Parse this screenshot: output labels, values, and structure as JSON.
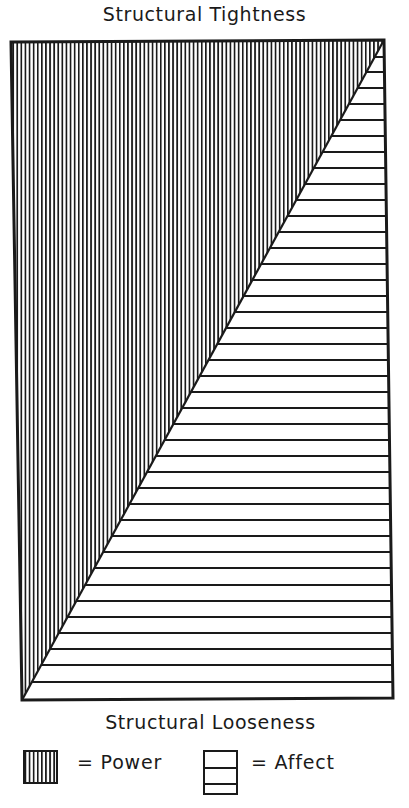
{
  "diagram": {
    "top_label": "Structural Tightness",
    "bottom_label": "Structural Looseness",
    "regions": [
      {
        "name": "Power",
        "pattern": "vertical-stripes",
        "position": "upper-left triangle"
      },
      {
        "name": "Affect",
        "pattern": "horizontal-lines",
        "position": "lower-right triangle"
      }
    ],
    "frame": {
      "top_left": [
        11,
        42
      ],
      "top_right": [
        384,
        40
      ],
      "bottom_right": [
        393,
        698
      ],
      "bottom_left": [
        22,
        700
      ]
    },
    "stroke_color": "#1a1a1a",
    "background_color": "#ffffff"
  },
  "legend": {
    "items": [
      {
        "symbol": "vertical-stripes-swatch",
        "label": "= Power"
      },
      {
        "symbol": "horizontal-lines-swatch",
        "label": "= Affect"
      }
    ]
  }
}
